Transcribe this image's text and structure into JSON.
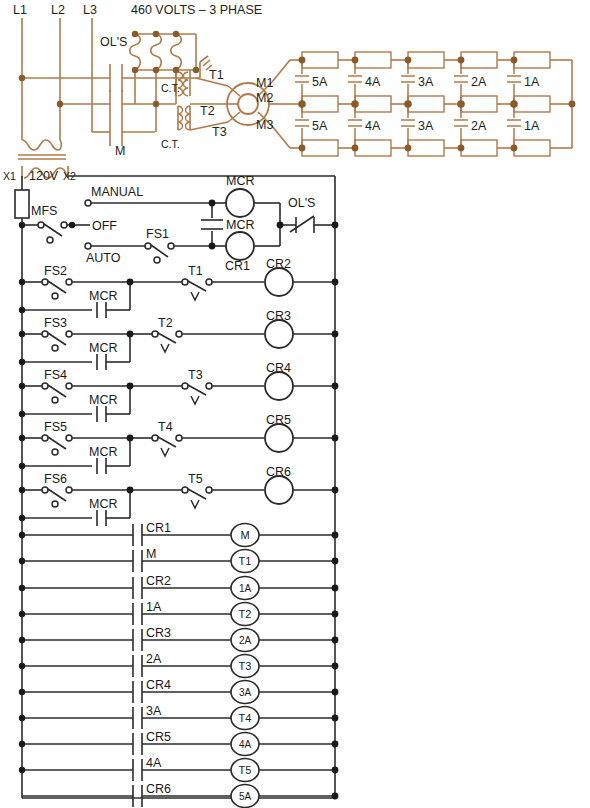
{
  "diagram": {
    "colors": {
      "power_wire": "#b07a4a",
      "power_node": "#8a5a2b",
      "control_wire": "#2b2b2b",
      "control_node": "#1a1a1a",
      "background": "#ffffff"
    }
  },
  "power_circuit": {
    "supply_label": "460 VOLTS – 3 PHASE",
    "lines": [
      {
        "name": "L1"
      },
      {
        "name": "L2"
      },
      {
        "name": "L3"
      }
    ],
    "overload_label": "OL'S",
    "contactor_label": "M",
    "ct_labels": [
      {
        "name": "C.T."
      },
      {
        "name": "C.T."
      }
    ],
    "motor_leads": [
      {
        "name": "T1"
      },
      {
        "name": "T2"
      },
      {
        "name": "T3"
      }
    ],
    "motor_terminals": [
      {
        "name": "M1"
      },
      {
        "name": "M2"
      },
      {
        "name": "M3"
      }
    ],
    "transformer": {
      "primary_label": "120V",
      "terminal_left": "X1",
      "terminal_right": "X2"
    },
    "resistor_bank": {
      "steps_top": [
        "5A",
        "4A",
        "3A",
        "2A",
        "1A"
      ],
      "steps_bottom": [
        "5A",
        "4A",
        "3A",
        "2A",
        "1A"
      ],
      "rows": 3,
      "columns": 5
    }
  },
  "control_circuit": {
    "fuse_label": "",
    "disconnect_label": "MFS",
    "selector": {
      "manual": "MANUAL",
      "off": "OFF",
      "auto": "AUTO"
    },
    "auto_switch": "FS1",
    "master_relay_contact": "MCR",
    "master_relay_coil": "MCR",
    "aux_relay_coil": "CR1",
    "overload_contact": "OL'S",
    "rungs": [
      {
        "switch": "FS2",
        "seal": "MCR",
        "timer_contact": "T1",
        "coil": "CR2"
      },
      {
        "switch": "FS3",
        "seal": "MCR",
        "timer_contact": "T2",
        "coil": "CR3"
      },
      {
        "switch": "FS4",
        "seal": "MCR",
        "timer_contact": "T3",
        "coil": "CR4"
      },
      {
        "switch": "FS5",
        "seal": "MCR",
        "timer_contact": "T4",
        "coil": "CR5"
      },
      {
        "switch": "FS6",
        "seal": "MCR",
        "timer_contact": "T5",
        "coil": "CR6"
      }
    ],
    "output_rungs": [
      {
        "contact": "CR1",
        "coil": "M"
      },
      {
        "contact": "M",
        "coil": "T1"
      },
      {
        "contact": "CR2",
        "coil": "1A"
      },
      {
        "contact": "1A",
        "coil": "T2"
      },
      {
        "contact": "CR3",
        "coil": "2A"
      },
      {
        "contact": "2A",
        "coil": "T3"
      },
      {
        "contact": "CR4",
        "coil": "3A"
      },
      {
        "contact": "3A",
        "coil": "T4"
      },
      {
        "contact": "CR5",
        "coil": "4A"
      },
      {
        "contact": "4A",
        "coil": "T5"
      },
      {
        "contact": "CR6",
        "coil": "5A"
      }
    ]
  }
}
